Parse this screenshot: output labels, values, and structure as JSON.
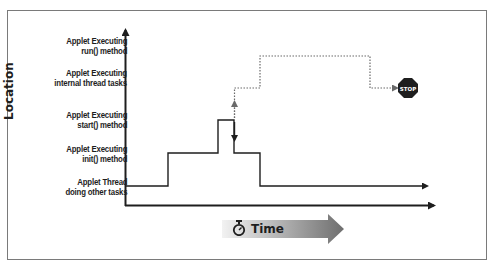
{
  "diagram": {
    "type": "step-timeline",
    "y_axis_title": "Location",
    "x_axis_title": "Time",
    "x_axis_icon": "stopwatch-icon",
    "levels": [
      {
        "id": "run",
        "line1": "Applet Executing",
        "line2": "run() method"
      },
      {
        "id": "internal",
        "line1": "Applet Executing",
        "line2": "internal thread tasks"
      },
      {
        "id": "start",
        "line1": "Applet Executing",
        "line2": "start() method"
      },
      {
        "id": "init",
        "line1": "Applet Executing",
        "line2": "init() method"
      },
      {
        "id": "other",
        "line1": "Applet Thread",
        "line2": "doing other tasks"
      }
    ],
    "solid_path": [
      "other",
      "init",
      "start",
      "init",
      "other"
    ],
    "dotted_path": [
      "start",
      "internal",
      "run",
      "internal",
      "stop"
    ],
    "stop_sign_label": "STOP",
    "colors": {
      "line": "#1e1e1e",
      "frame": "#7a7a7a",
      "stop_sign": "#1e1e1e",
      "time_arrow_start": "#f2f2f2",
      "time_arrow_end": "#6e6e6e"
    }
  }
}
